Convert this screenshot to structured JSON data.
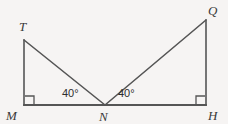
{
  "figure": {
    "background_color": "#f6f4f3",
    "stroke_color": "#555555",
    "label_color": "#3a3a3a",
    "angle_label_color": "#2e2e2e",
    "stroke_width": 1.6,
    "vertices": [
      {
        "id": "T",
        "label": "T",
        "x": 24,
        "y": 40,
        "label_x": 19,
        "label_y": 31
      },
      {
        "id": "Q",
        "label": "Q",
        "x": 206,
        "y": 20,
        "label_x": 208,
        "label_y": 15
      },
      {
        "id": "M",
        "label": "M",
        "x": 24,
        "y": 105,
        "label_x": 6,
        "label_y": 120
      },
      {
        "id": "N",
        "label": "N",
        "x": 105,
        "y": 105,
        "label_x": 99,
        "label_y": 121
      },
      {
        "id": "H",
        "label": "H",
        "x": 206,
        "y": 105,
        "label_x": 208,
        "label_y": 120
      }
    ],
    "segments": [
      {
        "name": "segment-MH",
        "from": "M",
        "to": "H"
      },
      {
        "name": "segment-MT",
        "from": "M",
        "to": "T"
      },
      {
        "name": "segment-TN",
        "from": "T",
        "to": "N"
      },
      {
        "name": "segment-NQ",
        "from": "N",
        "to": "Q"
      },
      {
        "name": "segment-QH",
        "from": "Q",
        "to": "H"
      }
    ],
    "right_angles": [
      {
        "name": "right-angle-M",
        "x": 25,
        "y": 96,
        "size": 9,
        "corner": "bottom-left"
      },
      {
        "name": "right-angle-H",
        "x": 196,
        "y": 96,
        "size": 9,
        "corner": "bottom-right"
      }
    ],
    "angle_labels": [
      {
        "name": "angle-TNM",
        "text": "40°",
        "x": 62,
        "y": 97
      },
      {
        "name": "angle-QNH",
        "text": "40°",
        "x": 118,
        "y": 97
      }
    ]
  }
}
